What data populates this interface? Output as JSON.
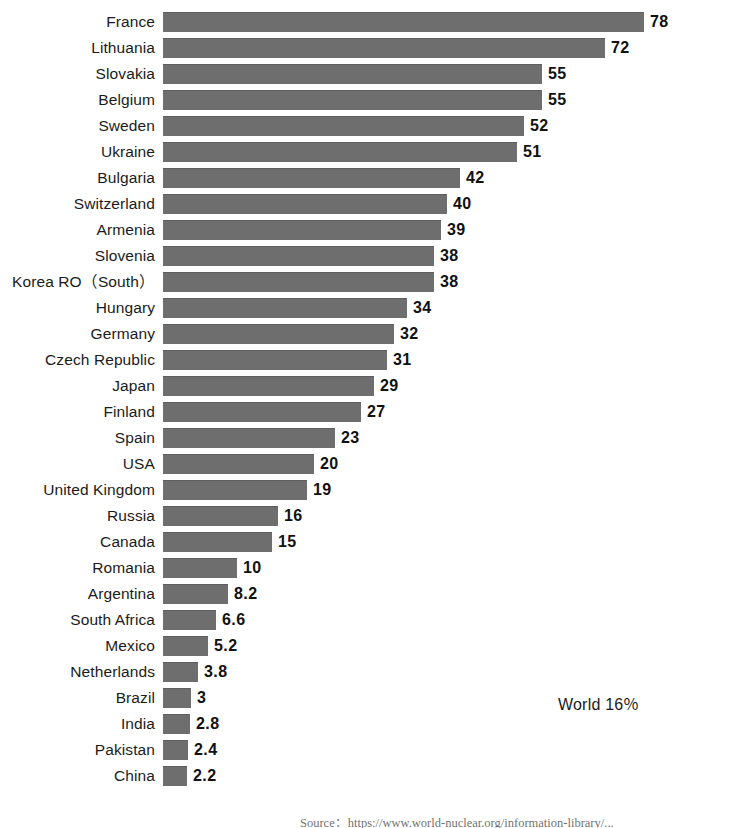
{
  "chart_data": {
    "type": "bar",
    "orientation": "horizontal",
    "title": "",
    "subtitle": "",
    "xlabel": "",
    "ylabel": "",
    "grid": false,
    "legend": "none",
    "axis_visible": false,
    "bar_color": "#6e6e6e",
    "background_color": "#ffffff",
    "value_label_position": "outside-end",
    "categories": [
      "France",
      "Lithuania",
      "Slovakia",
      "Belgium",
      "Sweden",
      "Ukraine",
      "Bulgaria",
      "Switzerland",
      "Armenia",
      "Slovenia",
      "Korea RO（South）",
      "Hungary",
      "Germany",
      "Czech Republic",
      "Japan",
      "Finland",
      "Spain",
      "USA",
      "United Kingdom",
      "Russia",
      "Canada",
      "Romania",
      "Argentina",
      "South Africa",
      "Mexico",
      "Netherlands",
      "Brazil",
      "India",
      "Pakistan",
      "China"
    ],
    "values": [
      78,
      72,
      55,
      55,
      52,
      51,
      42,
      40,
      39,
      38,
      38,
      34,
      32,
      31,
      29,
      27,
      23,
      20,
      19,
      16,
      15,
      10,
      8.2,
      6.6,
      5.2,
      3.8,
      3,
      2.8,
      2.4,
      2.2
    ],
    "value_labels": [
      "78",
      "72",
      "55",
      "55",
      "52",
      "51",
      "42",
      "40",
      "39",
      "38",
      "38",
      "34",
      "32",
      "31",
      "29",
      "27",
      "23",
      "20",
      "19",
      "16",
      "15",
      "10",
      "8.2",
      "6.6",
      "5.2",
      "3.8",
      "3",
      "2.8",
      "2.4",
      "2.2"
    ],
    "bar_pixel_widths": [
      481,
      442,
      379,
      379,
      361,
      354,
      297,
      284,
      278,
      271,
      271,
      244,
      231,
      224,
      211,
      198,
      172,
      151,
      144,
      115,
      109,
      74,
      65,
      53,
      45,
      35,
      28,
      27,
      25,
      24
    ],
    "xlim": [
      0,
      78
    ],
    "ylim": null
  },
  "annotation": {
    "world_label": "World 16％"
  },
  "source": {
    "note": "Source：https://www.world-nuclear.org/information-library/..."
  }
}
